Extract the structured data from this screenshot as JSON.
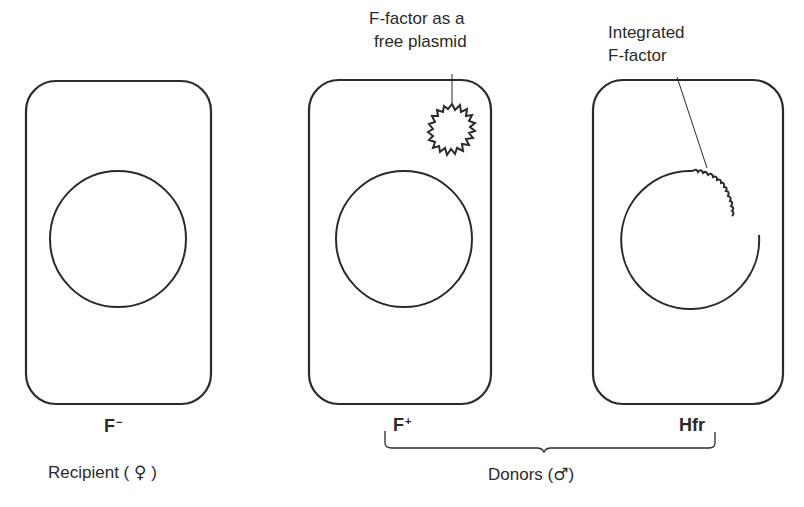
{
  "annotations": {
    "plasmid_label_line1": "F-factor as a",
    "plasmid_label_line2": "free plasmid",
    "integrated_label_line1": "Integrated",
    "integrated_label_line2": "F-factor"
  },
  "cells": [
    {
      "id": "f-minus",
      "label_base": "F",
      "label_sup": "−"
    },
    {
      "id": "f-plus",
      "label_base": "F",
      "label_sup": "+"
    },
    {
      "id": "hfr",
      "label_base": "Hfr",
      "label_sup": ""
    }
  ],
  "groups": {
    "recipient": "Recipient (",
    "recipient_symbol": "♀",
    "recipient_close": ")",
    "donors": "Donors (",
    "donors_symbol": "♂",
    "donors_close": ")"
  },
  "colors": {
    "stroke": "#2a2a2a",
    "background": "#ffffff"
  }
}
